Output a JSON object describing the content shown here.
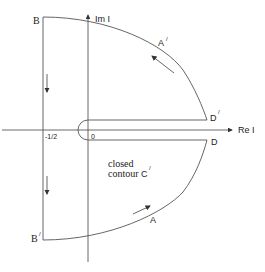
{
  "diagram": {
    "type": "keyhole-contour",
    "axes": {
      "real_label": "Re I",
      "imag_label": "Im I",
      "origin_label": "0",
      "left_tick_label": "-1/2"
    },
    "points": {
      "B": "B",
      "B_prime": "B",
      "B_prime_sup": "/",
      "A": "A",
      "A_prime": "A",
      "A_prime_sup": "/",
      "D": "D",
      "D_prime": "D",
      "D_prime_sup": "/"
    },
    "annotation": {
      "line1": "closed",
      "line2": "contour",
      "contour_name": "C",
      "contour_sup": "/"
    }
  }
}
